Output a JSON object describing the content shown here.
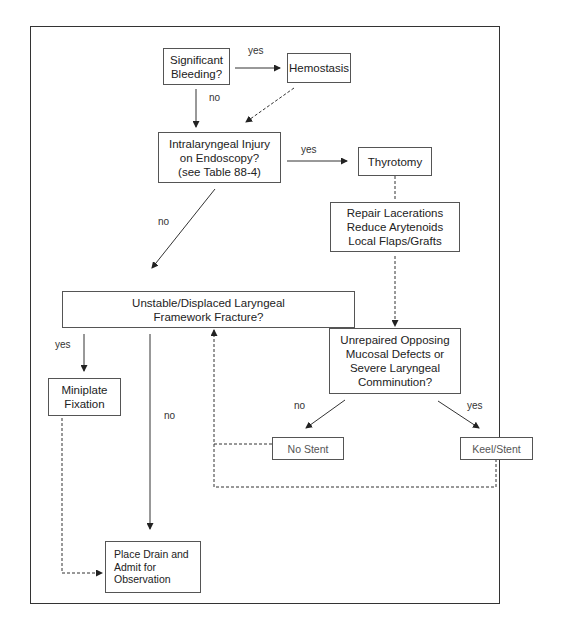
{
  "diagram": {
    "nodes": {
      "bleeding": "Significant\nBleeding?",
      "hemostasis": "Hemostasis",
      "intralaryngeal": "Intralaryngeal Injury\non Endoscopy?\n(see Table 88-4)",
      "thyrotomy": "Thyrotomy",
      "repair": "Repair Lacerations\nReduce Arytenoids\nLocal Flaps/Grafts",
      "unstable": "Unstable/Displaced Laryngeal\nFramework Fracture?",
      "unrepaired": "Unrepaired Opposing\nMucosal Defects or\nSevere Laryngeal\nComminution?",
      "miniplate": "Miniplate\nFixation",
      "no_stent": "No Stent",
      "keel_stent": "Keel/Stent",
      "place_drain": "Place Drain and\nAdmit for\nObservation"
    },
    "edge_labels": {
      "bleeding_yes": "yes",
      "bleeding_no": "no",
      "intralaryngeal_yes": "yes",
      "intralaryngeal_no": "no",
      "unstable_yes": "yes",
      "unstable_no": "no",
      "unrepaired_no": "no",
      "unrepaired_yes": "yes"
    },
    "edges": [
      {
        "from": "bleeding",
        "to": "hemostasis",
        "style": "solid",
        "label": "yes"
      },
      {
        "from": "bleeding",
        "to": "intralaryngeal",
        "style": "solid",
        "label": "no"
      },
      {
        "from": "hemostasis",
        "to": "intralaryngeal",
        "style": "dashed"
      },
      {
        "from": "intralaryngeal",
        "to": "thyrotomy",
        "style": "solid",
        "label": "yes"
      },
      {
        "from": "intralaryngeal",
        "to": "unstable",
        "style": "solid",
        "label": "no"
      },
      {
        "from": "thyrotomy",
        "to": "repair",
        "style": "dashed"
      },
      {
        "from": "repair",
        "to": "unrepaired",
        "style": "dashed"
      },
      {
        "from": "unrepaired",
        "to": "no_stent",
        "style": "solid",
        "label": "no"
      },
      {
        "from": "unrepaired",
        "to": "keel_stent",
        "style": "solid",
        "label": "yes"
      },
      {
        "from": "no_stent",
        "to": "unstable",
        "style": "dashed"
      },
      {
        "from": "keel_stent",
        "to": "unstable",
        "style": "dashed"
      },
      {
        "from": "unstable",
        "to": "miniplate",
        "style": "solid",
        "label": "yes"
      },
      {
        "from": "unstable",
        "to": "place_drain",
        "style": "solid",
        "label": "no"
      },
      {
        "from": "miniplate",
        "to": "place_drain",
        "style": "dashed"
      }
    ]
  }
}
